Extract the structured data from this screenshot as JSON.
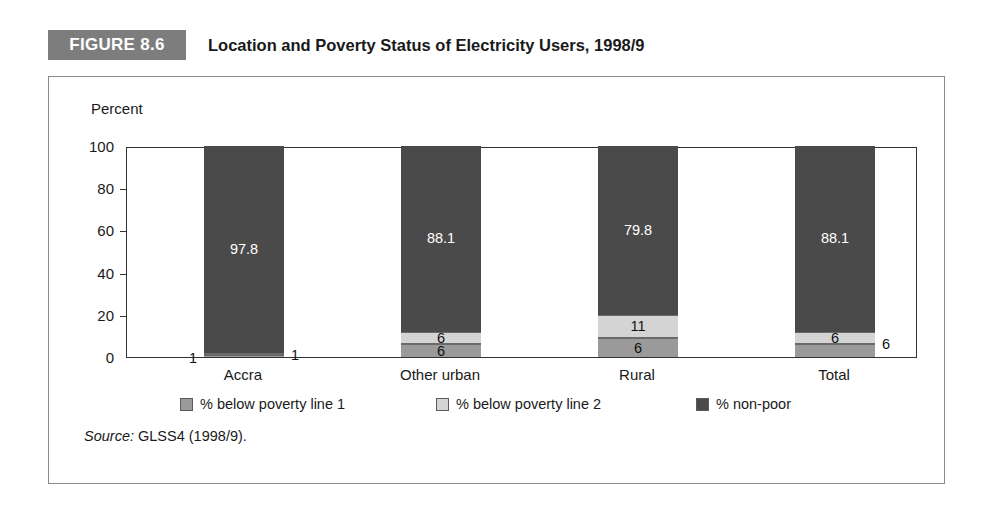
{
  "figure": {
    "badge": "FIGURE 8.6",
    "title": "Location and Poverty Status of Electricity Users, 1998/9"
  },
  "source": {
    "label": "Source:",
    "text": "GLSS4 (1998/9)."
  },
  "colors": {
    "non_poor": "#4a4a4a",
    "poverty_line_2": "#d4d4d4",
    "poverty_line_1": "#9a9a9a",
    "badge_bg": "#7d7d7d",
    "axis": "#333333",
    "frame": "#8a8a8a"
  },
  "chart_data": {
    "type": "bar",
    "subtype": "stacked-vertical",
    "title": "Location and Poverty Status of Electricity Users, 1998/9",
    "xlabel": "",
    "ylabel": "Percent",
    "ylim": [
      0,
      100
    ],
    "yticks": [
      0,
      20,
      40,
      60,
      80,
      100
    ],
    "grid": false,
    "legend_position": "bottom",
    "categories": [
      "Accra",
      "Other urban",
      "Rural",
      "Total"
    ],
    "series": [
      {
        "name": "% below poverty line 1",
        "color": "#9a9a9a",
        "values": [
          1,
          6,
          9,
          6
        ],
        "labels": [
          "1",
          "6",
          "6",
          "6"
        ],
        "label_positions": [
          "outside-right",
          "inside",
          "inside",
          "outside-right"
        ]
      },
      {
        "name": "% below poverty line 2",
        "color": "#d4d4d4",
        "values": [
          1,
          6,
          11,
          6
        ],
        "labels": [
          "1",
          "6",
          "11",
          "6"
        ],
        "label_positions": [
          "outside-left",
          "inside",
          "inside",
          "inside"
        ]
      },
      {
        "name": "% non-poor",
        "color": "#4a4a4a",
        "values": [
          97.8,
          88.1,
          79.8,
          88.1
        ],
        "labels": [
          "97.8",
          "88.1",
          "79.8",
          "88.1"
        ],
        "label_positions": [
          "inside",
          "inside",
          "inside",
          "inside"
        ]
      }
    ]
  },
  "axis": {
    "y_title": "Percent",
    "y_ticks": [
      "100",
      "80",
      "60",
      "40",
      "20",
      "0"
    ]
  },
  "legend": {
    "items": [
      {
        "label": "% below poverty line 1",
        "color": "#9a9a9a"
      },
      {
        "label": "% below poverty line 2",
        "color": "#d4d4d4"
      },
      {
        "label": "% non-poor",
        "color": "#4a4a4a"
      }
    ]
  }
}
